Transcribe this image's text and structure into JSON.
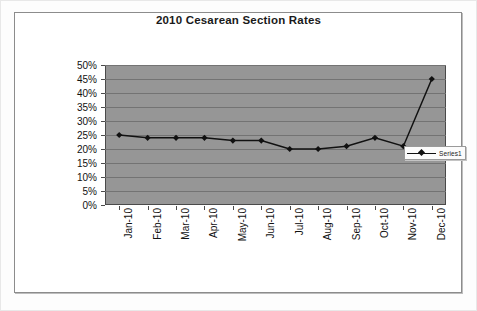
{
  "chart_data": {
    "type": "line",
    "title": "2010 Cesarean Section Rates",
    "xlabel": "",
    "ylabel": "",
    "categories": [
      "Jan-10",
      "Feb-10",
      "Mar-10",
      "Apr-10",
      "May-10",
      "Jun-10",
      "Jul-10",
      "Aug-10",
      "Sep-10",
      "Oct-10",
      "Nov-10",
      "Dec-10"
    ],
    "series": [
      {
        "name": "Series1",
        "values": [
          25,
          24,
          24,
          24,
          23,
          23,
          20,
          20,
          21,
          24,
          21,
          45
        ]
      }
    ],
    "ylim": [
      0,
      50
    ],
    "ytick_step": 5,
    "ytick_labels": [
      "0%",
      "5%",
      "10%",
      "15%",
      "20%",
      "25%",
      "30%",
      "35%",
      "40%",
      "45%",
      "50%"
    ],
    "grid": true,
    "legend_position": "right-inside",
    "marker": "diamond",
    "value_format": "percent",
    "colors": {
      "plot_background": "#969696",
      "gridline": "#737373",
      "series_line": "#111111",
      "marker": "#111111",
      "axis": "#4a4a4a",
      "text": "#111111",
      "frame": "#8c8c8c",
      "page_background": "#ffffff"
    }
  }
}
